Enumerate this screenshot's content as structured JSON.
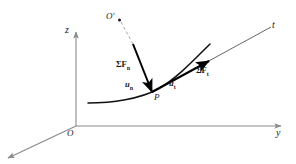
{
  "figure": {
    "type": "mechanics-diagram"
  },
  "axes": {
    "z_label": "z",
    "y_label": "y",
    "origin_label": "O"
  },
  "labels": {
    "center_of_curvature": "O′",
    "point_on_path": "P",
    "tangent_line": "t",
    "normal_force": "ΣF",
    "normal_force_sub": "n",
    "tangential_force": "ΣF",
    "tangential_force_sub": "t",
    "unit_normal": "u",
    "unit_normal_sub": "n",
    "unit_tangent": "u",
    "unit_tangent_sub": "t"
  },
  "colors": {
    "axis": "#8a8a8a",
    "curve": "#111111",
    "vector": "#000000",
    "dashed": "#9a9a9a",
    "text": "#1a1a1a",
    "background": "#ffffff"
  }
}
